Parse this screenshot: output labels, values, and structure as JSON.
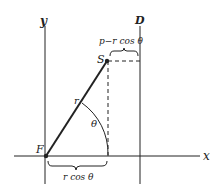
{
  "diagram": {
    "axis_labels": {
      "y": "y",
      "x": "x",
      "directrix": "D"
    },
    "points": {
      "focus": "F",
      "point": "S"
    },
    "segment_label": "r",
    "angle_label": "θ",
    "brace_top_label": "p−r cos θ",
    "brace_bottom_label": "r cos θ",
    "colors": {
      "line": "#222222",
      "background": "#ffffff"
    }
  }
}
